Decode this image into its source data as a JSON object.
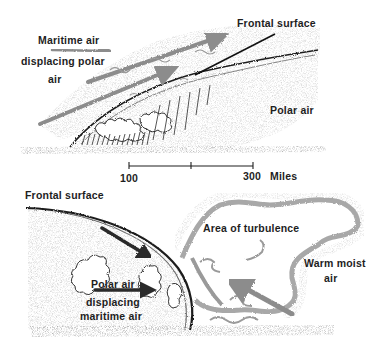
{
  "top_panel": {
    "labels": {
      "maritime_air_line1": "Maritime air",
      "maritime_air_line2": "displacing polar",
      "maritime_air_line3": "air",
      "frontal_surface": "Frontal surface",
      "polar_air": "Polar air"
    }
  },
  "scale_bar": {
    "left_label": "100",
    "right_label": "300",
    "unit": "Miles"
  },
  "bottom_panel": {
    "labels": {
      "frontal_surface": "Frontal surface",
      "area_of_turbulence": "Area of turbulence",
      "warm_moist_air_line1": "Warm moist",
      "warm_moist_air_line2": "air",
      "polar_air_line1": "Polar air",
      "polar_air_line2": "displacing",
      "polar_air_line3": "maritime air"
    }
  },
  "colors": {
    "ink": "#1e1e1e",
    "shading": "#9a9a9a",
    "arrow_gray": "#8c8c8c",
    "ground": "#3a3a3a"
  }
}
